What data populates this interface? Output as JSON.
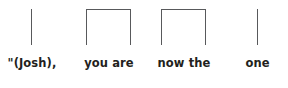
{
  "figure": {
    "type": "phrase-bracketing-diagram",
    "sentence": "\"(Josh), you are now the one",
    "background_color": "#ffffff",
    "stroke_color": "#58595b",
    "text_color": "#231f20"
  },
  "segments": [
    {
      "id": "segment-1",
      "label": "\"(Josh),",
      "mark": "vertical-line",
      "mark_icon": "vertical-line-icon",
      "left": 18,
      "width": 28,
      "mark_left": 31,
      "mark_width": 0,
      "mark_top": 9,
      "mark_height": 36,
      "label_left": 2,
      "label_width": 60,
      "label_top": 56
    },
    {
      "id": "segment-2",
      "label": "you are",
      "mark": "inverted-u-bracket",
      "mark_icon": "phrase-bracket-icon",
      "left": 86,
      "width": 46,
      "mark_left": 86,
      "mark_width": 45,
      "mark_top": 9,
      "mark_height": 36,
      "label_left": 80,
      "label_width": 58,
      "label_top": 56
    },
    {
      "id": "segment-3",
      "label": "now the",
      "mark": "inverted-u-bracket",
      "mark_icon": "phrase-bracket-icon",
      "left": 161,
      "width": 46,
      "mark_left": 161,
      "mark_width": 45,
      "mark_top": 9,
      "mark_height": 36,
      "label_left": 155,
      "label_width": 58,
      "label_top": 56
    },
    {
      "id": "segment-4",
      "label": "one",
      "mark": "vertical-line",
      "mark_icon": "vertical-line-icon",
      "left": 244,
      "width": 28,
      "mark_left": 257,
      "mark_width": 0,
      "mark_top": 9,
      "mark_height": 36,
      "label_left": 230,
      "label_width": 55,
      "label_top": 56
    }
  ]
}
